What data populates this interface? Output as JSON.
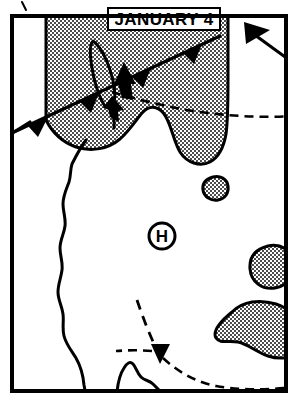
{
  "map": {
    "title": "JANUARY 4",
    "pressure_center_label": "H",
    "pressure_center_type": "high",
    "frame": {
      "x": 10,
      "y": 14,
      "width": 278,
      "height": 379,
      "border_color": "#000000",
      "border_width": 4,
      "background_color": "#ffffff"
    },
    "colors": {
      "ink": "#000000",
      "paper": "#ffffff",
      "stipple_fill": "#9a9a9a"
    },
    "title_box": {
      "x": 108,
      "y": 8,
      "width": 112,
      "height": 22
    },
    "pressure_center": {
      "cx": 162,
      "cy": 236,
      "radius": 13
    },
    "legend_icons": [
      "cold-front-icon",
      "trough-dashed-line-icon",
      "high-pressure-icon",
      "precipitation-shading-icon"
    ],
    "features": [
      {
        "name": "main-precipitation-area",
        "type": "stippled-region"
      },
      {
        "name": "small-precipitation-blob-upper",
        "type": "stippled-region"
      },
      {
        "name": "small-precipitation-blob-right",
        "type": "stippled-region"
      },
      {
        "name": "elongated-precipitation-blob-lower-right",
        "type": "stippled-region"
      },
      {
        "name": "cold-front-main",
        "type": "cold-front"
      },
      {
        "name": "cold-front-corner",
        "type": "cold-front"
      },
      {
        "name": "trough-line-east",
        "type": "dashed-trough"
      },
      {
        "name": "trough-line-south",
        "type": "dashed-trough"
      },
      {
        "name": "squall-line-loop",
        "type": "closed-contour"
      },
      {
        "name": "coastline",
        "type": "geographic-boundary"
      }
    ]
  }
}
